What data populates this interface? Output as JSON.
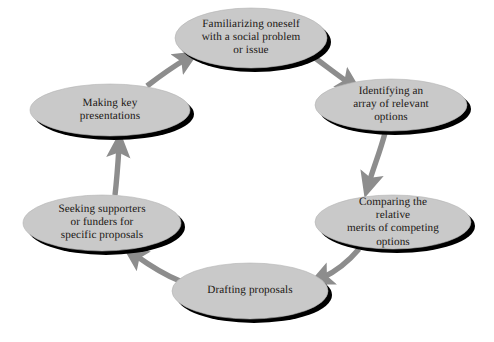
{
  "diagram": {
    "type": "cycle-flow-diagram",
    "background_color": "#ffffff",
    "node_fill_color": "#c9c9c9",
    "node_shadow_color": "#000000",
    "arrow_color": "#8d8d8d",
    "text_color": "#1a1613",
    "flow_direction": "clockwise",
    "nodes": [
      {
        "id": "familiarizing",
        "label": "Familiarizing oneself\nwith a social problem\nor issue",
        "cx": 251,
        "cy": 38,
        "rx": 76,
        "ry": 30
      },
      {
        "id": "identifying",
        "label": "Identifying an\narray of relevant\noptions",
        "cx": 391,
        "cy": 105,
        "rx": 76,
        "ry": 26
      },
      {
        "id": "comparing",
        "label": "Comparing the relative\nmerits of competing\noptions",
        "cx": 393,
        "cy": 222,
        "rx": 78,
        "ry": 27
      },
      {
        "id": "drafting",
        "label": "Drafting proposals",
        "cx": 250,
        "cy": 291,
        "rx": 78,
        "ry": 28
      },
      {
        "id": "seeking",
        "label": "Seeking supporters\nor funders for\nspecific proposals",
        "cx": 102,
        "cy": 223,
        "rx": 79,
        "ry": 28
      },
      {
        "id": "presentations",
        "label": "Making key\npresentations",
        "cx": 110,
        "cy": 110,
        "rx": 80,
        "ry": 26
      }
    ],
    "connectors": [
      {
        "id": "familiarizing-to-identifying",
        "from": "familiarizing",
        "to": "identifying"
      },
      {
        "id": "identifying-to-comparing",
        "from": "identifying",
        "to": "comparing"
      },
      {
        "id": "comparing-to-drafting",
        "from": "comparing",
        "to": "drafting"
      },
      {
        "id": "drafting-to-seeking",
        "from": "drafting",
        "to": "seeking"
      },
      {
        "id": "seeking-to-presentations",
        "from": "seeking",
        "to": "presentations"
      },
      {
        "id": "presentations-to-familiarizing",
        "from": "presentations",
        "to": "familiarizing"
      }
    ]
  }
}
